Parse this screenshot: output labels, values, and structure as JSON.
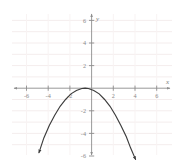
{
  "figure": {
    "name": "parabola-graph",
    "background_color": "#ffffff",
    "axis_color": "#8d8d8d",
    "grid_color": "#f3ecec",
    "curve_color": "#3c3c3c",
    "tick_label_color": "#8a8a8a"
  },
  "chart_data": {
    "type": "line",
    "title": "",
    "xlabel": "x",
    "ylabel": "y",
    "xlim": [
      -7,
      7
    ],
    "ylim": [
      -7,
      7
    ],
    "grid": true,
    "legend": "none",
    "x_ticks": [
      -6,
      -4,
      -2,
      2,
      4,
      6
    ],
    "x_tick_labels": [
      "-6",
      "-4",
      "-2",
      "2",
      "4",
      "6"
    ],
    "y_ticks": [
      6,
      4,
      2,
      -2,
      -4,
      -6
    ],
    "y_tick_labels": [
      "6",
      "4",
      "2",
      "-2",
      "-4",
      "-6"
    ],
    "equation": "y = -0.3(x + 0.6)^2",
    "vertex": [
      -0.6,
      0
    ],
    "opens": "down",
    "arrowheads": [
      "start",
      "end"
    ],
    "series": [
      {
        "name": "parabola",
        "x": [
          -4.85,
          -4.4,
          -3.9,
          -3.4,
          -2.9,
          -2.4,
          -1.9,
          -1.4,
          -0.9,
          -0.6,
          -0.3,
          0.2,
          0.7,
          1.2,
          1.7,
          2.2,
          2.7,
          3.2,
          3.6,
          4.05
        ],
        "y": [
          -5.7,
          -4.4,
          -3.3,
          -2.4,
          -1.6,
          -1.0,
          -0.5,
          -0.2,
          -0.03,
          0.0,
          -0.03,
          -0.2,
          -0.5,
          -1.0,
          -1.6,
          -2.4,
          -3.3,
          -4.3,
          -5.3,
          -6.3
        ]
      }
    ]
  },
  "axes": {
    "x_axis_label": "x",
    "y_axis_label": "y",
    "x_axis_name": "horizontal-axis",
    "y_axis_name": "vertical-axis"
  }
}
